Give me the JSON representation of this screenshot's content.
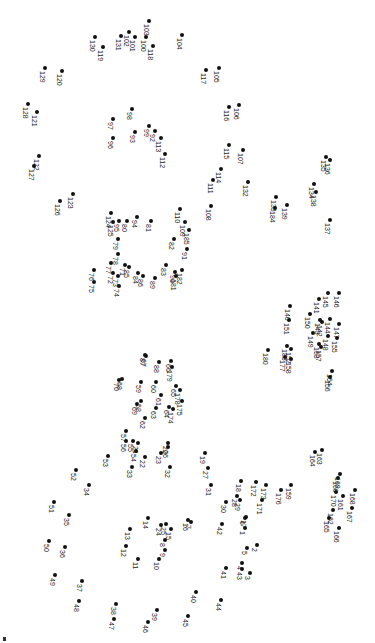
{
  "puzzle": {
    "title": "Connect the dots",
    "background": "#ffffff",
    "dot_color": "#111111",
    "orientation": "rotated-90",
    "dots": [
      {
        "n": "1",
        "x": 245,
        "y": 528
      },
      {
        "n": "2",
        "x": 257,
        "y": 545
      },
      {
        "n": "3",
        "x": 250,
        "y": 573
      },
      {
        "n": "4",
        "x": 242,
        "y": 563
      },
      {
        "n": "5",
        "x": 247,
        "y": 548
      },
      {
        "n": "6",
        "x": 245,
        "y": 518
      },
      {
        "n": "7",
        "x": 191,
        "y": 522
      },
      {
        "n": "8",
        "x": 165,
        "y": 540
      },
      {
        "n": "9",
        "x": 165,
        "y": 550
      },
      {
        "n": "10",
        "x": 159,
        "y": 559
      },
      {
        "n": "11",
        "x": 138,
        "y": 559
      },
      {
        "n": "12",
        "x": 126,
        "y": 546
      },
      {
        "n": "13",
        "x": 130,
        "y": 529
      },
      {
        "n": "14",
        "x": 148,
        "y": 518
      },
      {
        "n": "15",
        "x": 171,
        "y": 529
      },
      {
        "n": "16",
        "x": 188,
        "y": 520
      },
      {
        "n": "17",
        "x": 246,
        "y": 517
      },
      {
        "n": "18",
        "x": 241,
        "y": 481
      },
      {
        "n": "19",
        "x": 205,
        "y": 453
      },
      {
        "n": "20",
        "x": 168,
        "y": 443
      },
      {
        "n": "21",
        "x": 138,
        "y": 443
      },
      {
        "n": "22",
        "x": 145,
        "y": 457
      },
      {
        "n": "23",
        "x": 161,
        "y": 453
      },
      {
        "n": "24",
        "x": 161,
        "y": 525
      },
      {
        "n": "25",
        "x": 166,
        "y": 524
      },
      {
        "n": "26",
        "x": 168,
        "y": 447
      },
      {
        "n": "27",
        "x": 208,
        "y": 468
      },
      {
        "n": "28",
        "x": 237,
        "y": 496
      },
      {
        "n": "29",
        "x": 240,
        "y": 500
      },
      {
        "n": "30",
        "x": 226,
        "y": 502
      },
      {
        "n": "31",
        "x": 211,
        "y": 485
      },
      {
        "n": "32",
        "x": 170,
        "y": 467
      },
      {
        "n": "33",
        "x": 132,
        "y": 467
      },
      {
        "n": "34",
        "x": 89,
        "y": 485
      },
      {
        "n": "35",
        "x": 69,
        "y": 515
      },
      {
        "n": "36",
        "x": 65,
        "y": 547
      },
      {
        "n": "37",
        "x": 82,
        "y": 581
      },
      {
        "n": "38",
        "x": 116,
        "y": 604
      },
      {
        "n": "39",
        "x": 157,
        "y": 610
      },
      {
        "n": "40",
        "x": 196,
        "y": 592
      },
      {
        "n": "41",
        "x": 226,
        "y": 568
      },
      {
        "n": "42",
        "x": 222,
        "y": 524
      },
      {
        "n": "43",
        "x": 242,
        "y": 569
      },
      {
        "n": "44",
        "x": 221,
        "y": 600
      },
      {
        "n": "45",
        "x": 188,
        "y": 616
      },
      {
        "n": "46",
        "x": 148,
        "y": 622
      },
      {
        "n": "47",
        "x": 114,
        "y": 619
      },
      {
        "n": "48",
        "x": 79,
        "y": 601
      },
      {
        "n": "49",
        "x": 55,
        "y": 575
      },
      {
        "n": "50",
        "x": 49,
        "y": 541
      },
      {
        "n": "51",
        "x": 54,
        "y": 502
      },
      {
        "n": "52",
        "x": 76,
        "y": 470
      },
      {
        "n": "53",
        "x": 108,
        "y": 456
      },
      {
        "n": "54",
        "x": 136,
        "y": 451
      },
      {
        "n": "55",
        "x": 133,
        "y": 441
      },
      {
        "n": "56",
        "x": 126,
        "y": 441
      },
      {
        "n": "57",
        "x": 126,
        "y": 431
      },
      {
        "n": "58",
        "x": 141,
        "y": 401
      },
      {
        "n": "59",
        "x": 141,
        "y": 382
      },
      {
        "n": "60",
        "x": 156,
        "y": 382
      },
      {
        "n": "61",
        "x": 161,
        "y": 395
      },
      {
        "n": "62",
        "x": 145,
        "y": 418
      },
      {
        "n": "63",
        "x": 156,
        "y": 408
      },
      {
        "n": "64",
        "x": 169,
        "y": 407
      },
      {
        "n": "65",
        "x": 176,
        "y": 386
      },
      {
        "n": "66",
        "x": 171,
        "y": 361
      },
      {
        "n": "67",
        "x": 146,
        "y": 356
      },
      {
        "n": "68",
        "x": 122,
        "y": 379
      },
      {
        "n": "69",
        "x": 137,
        "y": 404
      },
      {
        "n": "70",
        "x": 119,
        "y": 380
      },
      {
        "n": "71",
        "x": 125,
        "y": 265
      },
      {
        "n": "72",
        "x": 113,
        "y": 273
      },
      {
        "n": "73",
        "x": 118,
        "y": 276
      },
      {
        "n": "74",
        "x": 119,
        "y": 286
      },
      {
        "n": "75",
        "x": 94,
        "y": 282
      },
      {
        "n": "76",
        "x": 94,
        "y": 270
      },
      {
        "n": "77",
        "x": 111,
        "y": 263
      },
      {
        "n": "78",
        "x": 118,
        "y": 254
      },
      {
        "n": "79",
        "x": 118,
        "y": 239
      },
      {
        "n": "80",
        "x": 127,
        "y": 221
      },
      {
        "n": "81",
        "x": 151,
        "y": 221
      },
      {
        "n": "82",
        "x": 174,
        "y": 239
      },
      {
        "n": "83",
        "x": 166,
        "y": 265
      },
      {
        "n": "84",
        "x": 138,
        "y": 273
      },
      {
        "n": "85",
        "x": 129,
        "y": 267
      },
      {
        "n": "86",
        "x": 143,
        "y": 276
      },
      {
        "n": "87",
        "x": 145,
        "y": 355
      },
      {
        "n": "88",
        "x": 159,
        "y": 362
      },
      {
        "n": "89",
        "x": 155,
        "y": 278
      },
      {
        "n": "90",
        "x": 175,
        "y": 272
      },
      {
        "n": "91",
        "x": 187,
        "y": 249
      },
      {
        "n": "92",
        "x": 155,
        "y": 131
      },
      {
        "n": "93",
        "x": 135,
        "y": 132
      },
      {
        "n": "94",
        "x": 137,
        "y": 217
      },
      {
        "n": "95",
        "x": 119,
        "y": 221
      },
      {
        "n": "96",
        "x": 113,
        "y": 138
      },
      {
        "n": "97",
        "x": 113,
        "y": 119
      },
      {
        "n": "98",
        "x": 132,
        "y": 109
      },
      {
        "n": "99",
        "x": 149,
        "y": 126
      },
      {
        "n": "100",
        "x": 146,
        "y": 37
      },
      {
        "n": "101",
        "x": 135,
        "y": 37
      },
      {
        "n": "102",
        "x": 129,
        "y": 32
      },
      {
        "n": "103",
        "x": 149,
        "y": 21
      },
      {
        "n": "104",
        "x": 182,
        "y": 35
      },
      {
        "n": "105",
        "x": 219,
        "y": 68
      },
      {
        "n": "106",
        "x": 239,
        "y": 105
      },
      {
        "n": "107",
        "x": 243,
        "y": 150
      },
      {
        "n": "108",
        "x": 211,
        "y": 206
      },
      {
        "n": "109",
        "x": 185,
        "y": 222
      },
      {
        "n": "110",
        "x": 180,
        "y": 209
      },
      {
        "n": "111",
        "x": 213,
        "y": 180
      },
      {
        "n": "112",
        "x": 165,
        "y": 154
      },
      {
        "n": "113",
        "x": 161,
        "y": 138
      },
      {
        "n": "114",
        "x": 221,
        "y": 169
      },
      {
        "n": "115",
        "x": 229,
        "y": 145
      },
      {
        "n": "116",
        "x": 229,
        "y": 107
      },
      {
        "n": "117",
        "x": 206,
        "y": 70
      },
      {
        "n": "118",
        "x": 153,
        "y": 46
      },
      {
        "n": "119",
        "x": 103,
        "y": 47
      },
      {
        "n": "120",
        "x": 62,
        "y": 71
      },
      {
        "n": "121",
        "x": 37,
        "y": 112
      },
      {
        "n": "122",
        "x": 39,
        "y": 156
      },
      {
        "n": "123",
        "x": 73,
        "y": 194
      },
      {
        "n": "124",
        "x": 111,
        "y": 213
      },
      {
        "n": "125",
        "x": 113,
        "y": 222
      },
      {
        "n": "126",
        "x": 60,
        "y": 201
      },
      {
        "n": "127",
        "x": 34,
        "y": 166
      },
      {
        "n": "128",
        "x": 28,
        "y": 104
      },
      {
        "n": "129",
        "x": 45,
        "y": 68
      },
      {
        "n": "130",
        "x": 95,
        "y": 37
      },
      {
        "n": "131",
        "x": 121,
        "y": 36
      },
      {
        "n": "132",
        "x": 248,
        "y": 182
      },
      {
        "n": "133",
        "x": 276,
        "y": 197
      },
      {
        "n": "134",
        "x": 314,
        "y": 184
      },
      {
        "n": "135",
        "x": 326,
        "y": 157
      },
      {
        "n": "136",
        "x": 330,
        "y": 160
      },
      {
        "n": "137",
        "x": 330,
        "y": 220
      },
      {
        "n": "138",
        "x": 316,
        "y": 192
      },
      {
        "n": "139",
        "x": 287,
        "y": 205
      },
      {
        "n": "140",
        "x": 290,
        "y": 306
      },
      {
        "n": "141",
        "x": 319,
        "y": 299
      },
      {
        "n": "142",
        "x": 322,
        "y": 322
      },
      {
        "n": "143",
        "x": 320,
        "y": 320
      },
      {
        "n": "144",
        "x": 330,
        "y": 319
      },
      {
        "n": "145",
        "x": 328,
        "y": 293
      },
      {
        "n": "146",
        "x": 339,
        "y": 293
      },
      {
        "n": "147",
        "x": 339,
        "y": 324
      },
      {
        "n": "148",
        "x": 328,
        "y": 336
      },
      {
        "n": "149",
        "x": 313,
        "y": 333
      },
      {
        "n": "150",
        "x": 310,
        "y": 314
      },
      {
        "n": "151",
        "x": 289,
        "y": 320
      },
      {
        "n": "152",
        "x": 291,
        "y": 349
      },
      {
        "n": "153",
        "x": 319,
        "y": 344
      },
      {
        "n": "154",
        "x": 332,
        "y": 371
      },
      {
        "n": "155",
        "x": 337,
        "y": 338
      },
      {
        "n": "156",
        "x": 330,
        "y": 377
      },
      {
        "n": "157",
        "x": 321,
        "y": 347
      },
      {
        "n": "158",
        "x": 291,
        "y": 359
      },
      {
        "n": "159",
        "x": 291,
        "y": 485
      },
      {
        "n": "160",
        "x": 338,
        "y": 478
      },
      {
        "n": "161",
        "x": 343,
        "y": 496
      },
      {
        "n": "162",
        "x": 333,
        "y": 510
      },
      {
        "n": "163",
        "x": 322,
        "y": 450
      },
      {
        "n": "164",
        "x": 315,
        "y": 452
      },
      {
        "n": "165",
        "x": 329,
        "y": 518
      },
      {
        "n": "166",
        "x": 339,
        "y": 528
      },
      {
        "n": "167",
        "x": 352,
        "y": 508
      },
      {
        "n": "168",
        "x": 355,
        "y": 490
      },
      {
        "n": "169",
        "x": 340,
        "y": 474
      },
      {
        "n": "170",
        "x": 336,
        "y": 492
      },
      {
        "n": "171",
        "x": 262,
        "y": 500
      },
      {
        "n": "172",
        "x": 256,
        "y": 482
      },
      {
        "n": "173",
        "x": 266,
        "y": 485
      },
      {
        "n": "174",
        "x": 173,
        "y": 409
      },
      {
        "n": "175",
        "x": 182,
        "y": 401
      },
      {
        "n": "176",
        "x": 281,
        "y": 490
      },
      {
        "n": "177",
        "x": 285,
        "y": 357
      },
      {
        "n": "178",
        "x": 180,
        "y": 390
      },
      {
        "n": "179",
        "x": 172,
        "y": 367
      },
      {
        "n": "180",
        "x": 268,
        "y": 350
      },
      {
        "n": "181",
        "x": 176,
        "y": 276
      },
      {
        "n": "182",
        "x": 182,
        "y": 270
      },
      {
        "n": "183",
        "x": 287,
        "y": 346
      },
      {
        "n": "184",
        "x": 275,
        "y": 208
      },
      {
        "n": "185",
        "x": 189,
        "y": 230
      }
    ]
  }
}
